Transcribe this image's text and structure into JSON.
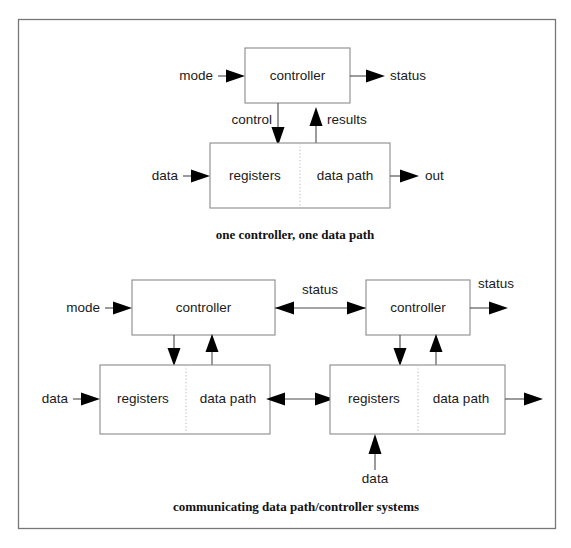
{
  "figure": {
    "title_alt": "data path / controller system block diagrams",
    "background_color": "#ffffff",
    "border_color": "#777777",
    "box_stroke_color": "#8a8a8a",
    "wire_color": "#4a4a4a",
    "arrowhead_color": "#000000",
    "divider_color": "#bdbdbd"
  },
  "diagram_top": {
    "caption": "one controller, one data path",
    "controller": {
      "label": "controller"
    },
    "datapath_block": {
      "left_label": "registers",
      "right_label": "data path"
    },
    "signals": {
      "mode": "mode",
      "status": "status",
      "control": "control",
      "results": "results",
      "data_in": "data",
      "out": "out"
    }
  },
  "diagram_bottom": {
    "caption": "communicating data path/controller systems",
    "left_system": {
      "controller": {
        "label": "controller"
      },
      "datapath_block": {
        "left_label": "registers",
        "right_label": "data path"
      },
      "signals": {
        "mode": "mode",
        "data_in": "data"
      }
    },
    "right_system": {
      "controller": {
        "label": "controller"
      },
      "datapath_block": {
        "left_label": "registers",
        "right_label": "data path"
      },
      "signals": {
        "status_out": "status",
        "data_in": "data"
      }
    },
    "interconnect": {
      "controller_link_label": "status"
    }
  }
}
